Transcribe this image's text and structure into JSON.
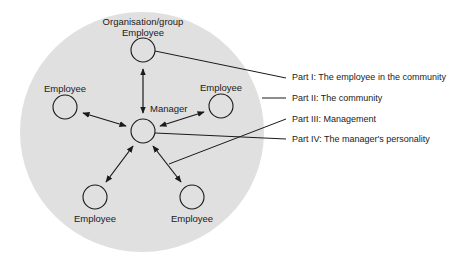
{
  "diagram": {
    "group_label": "Organisation/group",
    "center_node": {
      "label": "Manager"
    },
    "employee_nodes": [
      {
        "label": "Employee",
        "position": "top"
      },
      {
        "label": "Employee",
        "position": "left"
      },
      {
        "label": "Employee",
        "position": "right"
      },
      {
        "label": "Employee",
        "position": "bottom-left"
      },
      {
        "label": "Employee",
        "position": "bottom-right"
      }
    ],
    "parts": [
      {
        "label": "Part I: The employee in the community"
      },
      {
        "label": "Part II: The community"
      },
      {
        "label": "Part III: Management"
      },
      {
        "label": "Part IV: The manager's personality"
      }
    ],
    "colors": {
      "group_fill": "#e0e0e0",
      "stroke": "#1a1a1a"
    }
  }
}
